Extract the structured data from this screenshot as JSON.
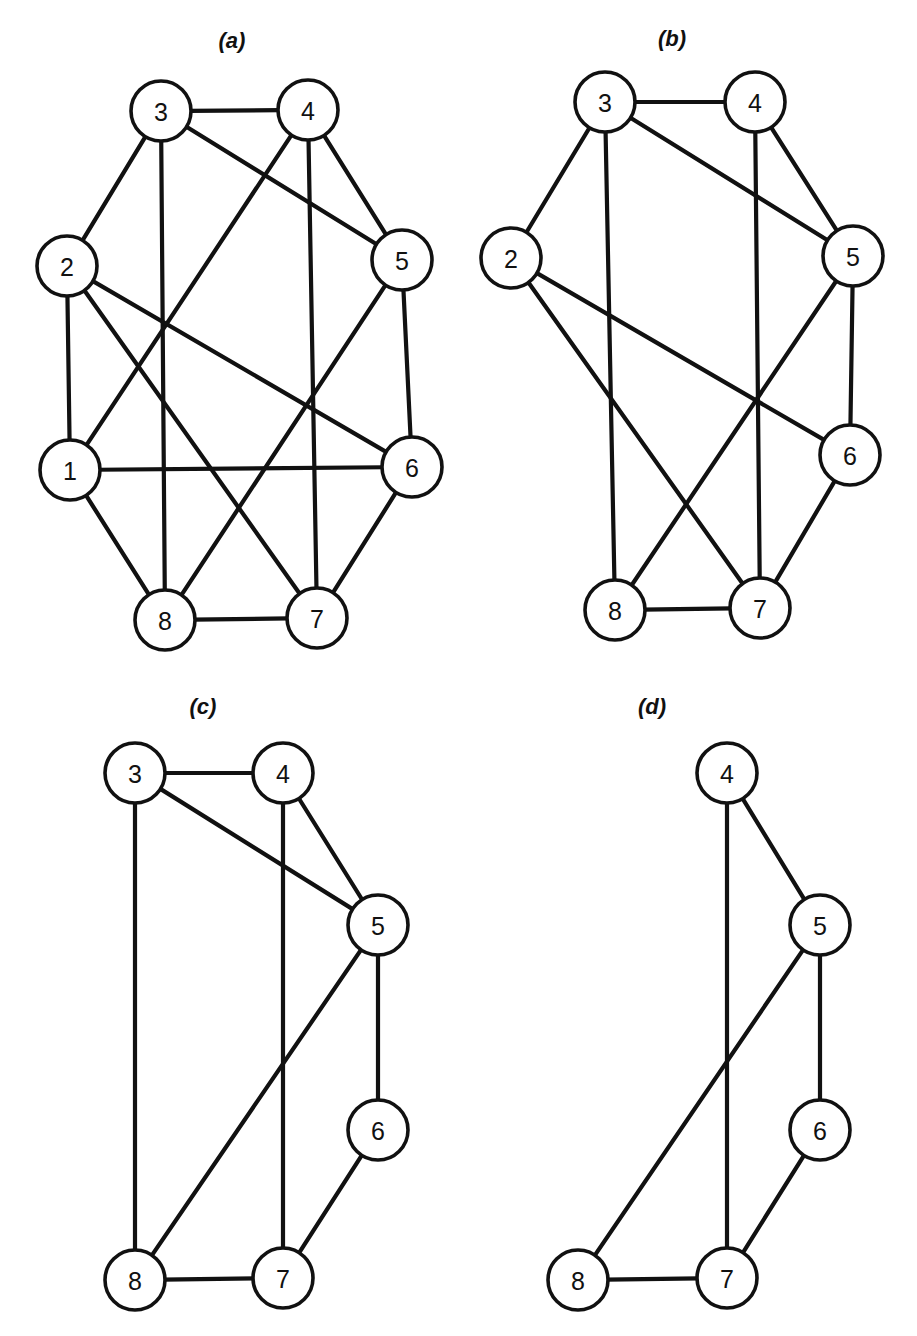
{
  "figure": {
    "title": "",
    "background_color": "#ffffff",
    "ink_color": "#111111",
    "node_fill_color": "#ffffff",
    "width": 917,
    "height": 1336
  },
  "chart_data": {
    "type": "diagram",
    "subtype": "undirected-graph-series",
    "panels": [
      {
        "id": "a",
        "caption": "(a)",
        "caption_pos": {
          "x": 232,
          "y": 42
        },
        "node_radius": 30,
        "nodes": [
          {
            "id": "1",
            "label": "1",
            "x": 70,
            "y": 470
          },
          {
            "id": "2",
            "label": "2",
            "x": 67,
            "y": 266
          },
          {
            "id": "3",
            "label": "3",
            "x": 161,
            "y": 111
          },
          {
            "id": "4",
            "label": "4",
            "x": 308,
            "y": 110
          },
          {
            "id": "5",
            "label": "5",
            "x": 402,
            "y": 260
          },
          {
            "id": "6",
            "label": "6",
            "x": 412,
            "y": 467
          },
          {
            "id": "7",
            "label": "7",
            "x": 317,
            "y": 618
          },
          {
            "id": "8",
            "label": "8",
            "x": 165,
            "y": 620
          }
        ],
        "edges": [
          [
            "3",
            "4"
          ],
          [
            "3",
            "2"
          ],
          [
            "3",
            "8"
          ],
          [
            "3",
            "5"
          ],
          [
            "4",
            "1"
          ],
          [
            "4",
            "7"
          ],
          [
            "4",
            "5"
          ],
          [
            "2",
            "1"
          ],
          [
            "2",
            "6"
          ],
          [
            "2",
            "7"
          ],
          [
            "1",
            "6"
          ],
          [
            "1",
            "8"
          ],
          [
            "5",
            "6"
          ],
          [
            "5",
            "8"
          ],
          [
            "6",
            "7"
          ],
          [
            "8",
            "7"
          ]
        ]
      },
      {
        "id": "b",
        "caption": "(b)",
        "caption_pos": {
          "x": 672,
          "y": 40
        },
        "node_radius": 30,
        "nodes": [
          {
            "id": "2",
            "label": "2",
            "x": 511,
            "y": 258
          },
          {
            "id": "3",
            "label": "3",
            "x": 605,
            "y": 102
          },
          {
            "id": "4",
            "label": "4",
            "x": 755,
            "y": 102
          },
          {
            "id": "5",
            "label": "5",
            "x": 853,
            "y": 256
          },
          {
            "id": "6",
            "label": "6",
            "x": 850,
            "y": 455
          },
          {
            "id": "7",
            "label": "7",
            "x": 760,
            "y": 608
          },
          {
            "id": "8",
            "label": "8",
            "x": 615,
            "y": 610
          }
        ],
        "edges": [
          [
            "3",
            "4"
          ],
          [
            "3",
            "2"
          ],
          [
            "3",
            "8"
          ],
          [
            "3",
            "5"
          ],
          [
            "4",
            "7"
          ],
          [
            "4",
            "5"
          ],
          [
            "2",
            "6"
          ],
          [
            "2",
            "7"
          ],
          [
            "5",
            "6"
          ],
          [
            "5",
            "8"
          ],
          [
            "6",
            "7"
          ],
          [
            "8",
            "7"
          ]
        ]
      },
      {
        "id": "c",
        "caption": "(c)",
        "caption_pos": {
          "x": 203,
          "y": 708
        },
        "node_radius": 30,
        "nodes": [
          {
            "id": "3",
            "label": "3",
            "x": 135,
            "y": 773
          },
          {
            "id": "4",
            "label": "4",
            "x": 283,
            "y": 773
          },
          {
            "id": "5",
            "label": "5",
            "x": 378,
            "y": 925
          },
          {
            "id": "6",
            "label": "6",
            "x": 378,
            "y": 1130
          },
          {
            "id": "7",
            "label": "7",
            "x": 283,
            "y": 1278
          },
          {
            "id": "8",
            "label": "8",
            "x": 135,
            "y": 1280
          }
        ],
        "edges": [
          [
            "3",
            "4"
          ],
          [
            "3",
            "8"
          ],
          [
            "3",
            "5"
          ],
          [
            "4",
            "7"
          ],
          [
            "4",
            "5"
          ],
          [
            "5",
            "6"
          ],
          [
            "5",
            "8"
          ],
          [
            "6",
            "7"
          ],
          [
            "8",
            "7"
          ]
        ]
      },
      {
        "id": "d",
        "caption": "(d)",
        "caption_pos": {
          "x": 652,
          "y": 708
        },
        "node_radius": 30,
        "nodes": [
          {
            "id": "4",
            "label": "4",
            "x": 727,
            "y": 773
          },
          {
            "id": "5",
            "label": "5",
            "x": 820,
            "y": 925
          },
          {
            "id": "6",
            "label": "6",
            "x": 820,
            "y": 1130
          },
          {
            "id": "7",
            "label": "7",
            "x": 727,
            "y": 1278
          },
          {
            "id": "8",
            "label": "8",
            "x": 578,
            "y": 1280
          }
        ],
        "edges": [
          [
            "4",
            "5"
          ],
          [
            "4",
            "7"
          ],
          [
            "5",
            "6"
          ],
          [
            "5",
            "8"
          ],
          [
            "6",
            "7"
          ],
          [
            "8",
            "7"
          ]
        ]
      }
    ]
  }
}
